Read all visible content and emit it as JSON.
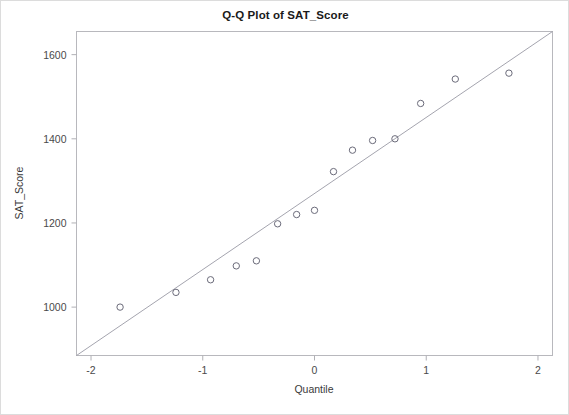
{
  "chart_data": {
    "type": "scatter",
    "title": "Q-Q Plot of SAT_Score",
    "xlabel": "Quantile",
    "ylabel": "SAT_Score",
    "xlim": [
      -2.13,
      2.13
    ],
    "ylim": [
      885,
      1655
    ],
    "grid": false,
    "legend": null,
    "xticks": [
      -2,
      -1,
      0,
      1,
      2
    ],
    "xtick_labels": [
      "-2",
      "-1",
      "0",
      "1",
      "2"
    ],
    "yticks": [
      1000,
      1200,
      1400,
      1600
    ],
    "ytick_labels": [
      "1000",
      "1200",
      "1400",
      "1600"
    ],
    "marker": "open-circle",
    "marker_color": "#6b6b7a",
    "reference_line": {
      "label": "normal reference line",
      "color": "#9a9aa5",
      "x": [
        -2.13,
        2.13
      ],
      "y": [
        885,
        1655
      ]
    },
    "points": [
      {
        "x": -1.74,
        "y": 1000
      },
      {
        "x": -1.24,
        "y": 1035
      },
      {
        "x": -0.93,
        "y": 1065
      },
      {
        "x": -0.7,
        "y": 1098
      },
      {
        "x": -0.52,
        "y": 1110
      },
      {
        "x": -0.33,
        "y": 1198
      },
      {
        "x": -0.16,
        "y": 1220
      },
      {
        "x": 0.0,
        "y": 1230
      },
      {
        "x": 0.17,
        "y": 1322
      },
      {
        "x": 0.34,
        "y": 1373
      },
      {
        "x": 0.52,
        "y": 1396
      },
      {
        "x": 0.72,
        "y": 1400
      },
      {
        "x": 0.95,
        "y": 1484
      },
      {
        "x": 1.26,
        "y": 1542
      },
      {
        "x": 1.74,
        "y": 1556
      }
    ]
  },
  "axes": {
    "frame_color": "#b8b8bd",
    "tick_color": "#b0b0b5"
  }
}
